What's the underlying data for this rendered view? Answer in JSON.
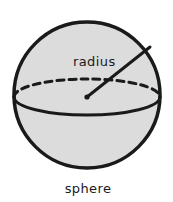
{
  "figure": {
    "name": "sphere-diagram",
    "caption": "sphere",
    "background_color": "#ffffff",
    "stroke_color": "#1a1a1a",
    "fill_color": "#dcdcdc",
    "labels": {
      "radius": "radius"
    },
    "geometry": {
      "circle": {
        "cx": 87,
        "cy": 95,
        "r": 73,
        "stroke_width": 3.5
      },
      "equator_ellipse": {
        "cx": 87,
        "cy": 97,
        "rx": 73,
        "ry": 18,
        "back_half_style": "dashed",
        "front_half_style": "solid",
        "dash_pattern": "7,5",
        "stroke_width": 3
      },
      "radius_line": {
        "x1": 87,
        "y1": 97,
        "x2": 150,
        "y2": 47,
        "stroke_width": 3
      },
      "center_dot": {
        "cx": 87,
        "cy": 97,
        "r": 2.6
      },
      "radius_label_position": {
        "x": 73,
        "y": 66
      },
      "caption_position": {
        "x": 88,
        "y": 193
      }
    }
  }
}
